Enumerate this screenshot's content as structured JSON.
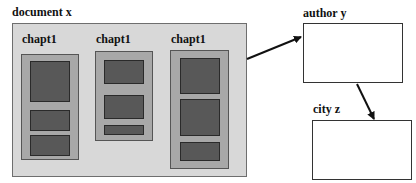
{
  "document": {
    "label": "document x",
    "chapters": [
      {
        "label": "chapt1",
        "sections": 3
      },
      {
        "label": "chapt1",
        "sections": 3
      },
      {
        "label": "chapt1",
        "sections": 3
      }
    ]
  },
  "entities": {
    "author": {
      "label": "author y"
    },
    "city": {
      "label": "city z"
    }
  },
  "colors": {
    "document_bg": "#d8d8d8",
    "chapter_bg": "#a8a8a8",
    "section_bg": "#585858",
    "entity_bg": "#ffffff",
    "arrow": "#111111"
  }
}
